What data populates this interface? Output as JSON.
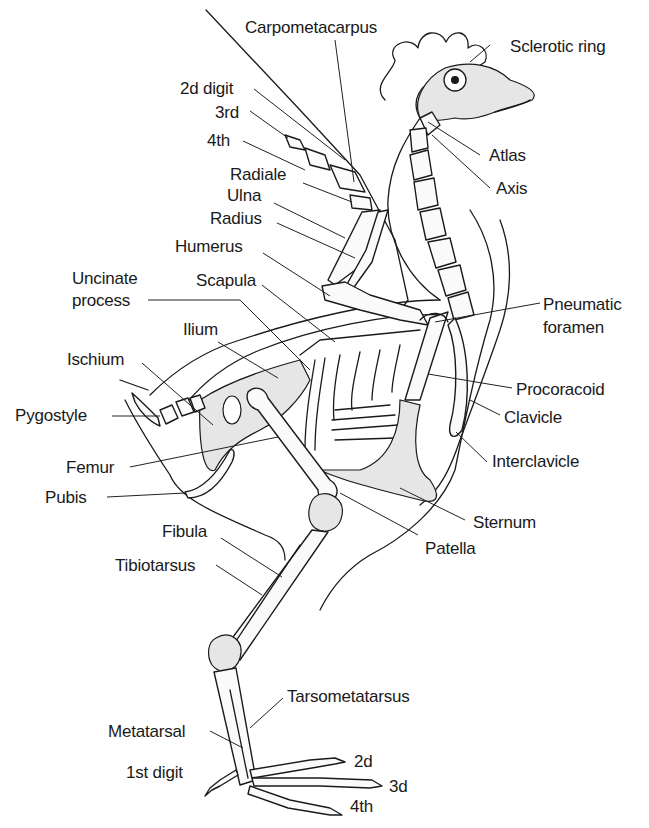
{
  "diagram": {
    "labels": {
      "carpometacarpus": "Carpometacarpus",
      "sclerotic_ring": "Sclerotic ring",
      "digit_2d": "2d digit",
      "digit_3rd": "3rd",
      "digit_4th": "4th",
      "radiale": "Radiale",
      "ulna": "Ulna",
      "radius": "Radius",
      "atlas": "Atlas",
      "axis": "Axis",
      "humerus": "Humerus",
      "uncinate_process_1": "Uncinate",
      "uncinate_process_2": "process",
      "scapula": "Scapula",
      "pneumatic_foramen_1": "Pneumatic",
      "pneumatic_foramen_2": "foramen",
      "ilium": "Ilium",
      "ischium": "Ischium",
      "procoracoid": "Procoracoid",
      "pygostyle": "Pygostyle",
      "clavicle": "Clavicle",
      "femur": "Femur",
      "interclavicle": "Interclavicle",
      "pubis": "Pubis",
      "sternum": "Sternum",
      "fibula": "Fibula",
      "patella": "Patella",
      "tibiotarsus": "Tibiotarsus",
      "tarsometatarsus": "Tarsometatarsus",
      "metatarsal": "Metatarsal",
      "toe_2d": "2d",
      "toe_1st_digit": "1st digit",
      "toe_3d": "3d",
      "toe_4th": "4th"
    }
  }
}
